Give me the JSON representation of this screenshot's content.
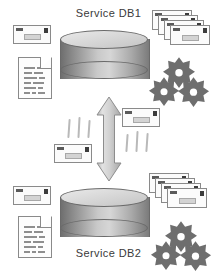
{
  "diagram": {
    "title_top": "Service DB1",
    "title_bottom": "Service DB2",
    "colors": {
      "background": "#ffffff",
      "text": "#3a3a3a",
      "cylinder_light": "#d6d6d6",
      "cylinder_dark": "#6f6f6f",
      "outline": "#8a8a8a",
      "gear_fill": "#6e6e6e",
      "arrow_fill": "#cfcfcf",
      "tick": "#b9b9b9",
      "envelope_fill": "#fbfbfb",
      "document_fill": "#fdfdfd"
    },
    "nodes": {
      "db_top": {
        "name": "Service DB1",
        "shape": "cylinder"
      },
      "db_bottom": {
        "name": "Service DB2",
        "shape": "cylinder"
      },
      "arrow": {
        "name": "bidirectional-sync-arrow",
        "direction": "up-down"
      }
    },
    "icons": {
      "envelope": "envelope-icon",
      "envelope_stack": "envelope-stack-icon",
      "document": "document-icon",
      "gear": "gear-icon",
      "gear_cluster": "gear-cluster-icon",
      "arrow": "double-arrow-icon",
      "tick": "tick-mark"
    },
    "counts": {
      "envelope_stack_cards": 4,
      "gears_per_cluster": 3,
      "tick_groups": 2,
      "ticks_per_group": 3
    }
  }
}
